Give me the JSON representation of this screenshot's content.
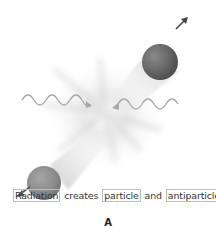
{
  "figure": {
    "panel_label": "A",
    "caption": {
      "word1": "Radiation",
      "word2": "creates",
      "word3": "particle",
      "word4": "and",
      "word5": "antiparticle."
    },
    "elements": {
      "incoming_waves": [
        "left-wave",
        "right-wave"
      ],
      "particles": [
        "upper-right-particle",
        "lower-left-particle"
      ],
      "arrows": [
        "upper-right-direction-arrow",
        "lower-left-direction-arrow"
      ]
    },
    "colors": {
      "wave": "#a8a8a8",
      "particle_upper": "#6a6a6a",
      "particle_lower": "#8e8e8e",
      "burst": "#d6d6d6",
      "arrow": "#444444",
      "box_border": "#bdbdbd",
      "text": "#333333"
    }
  }
}
